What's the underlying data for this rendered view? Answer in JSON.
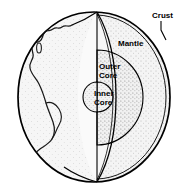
{
  "figure": {
    "kind": "earth-cutaway-cross-section-diagram",
    "style": "black-and-white-line-art-with-stipple-shading",
    "background_color": "#ffffff",
    "line_color": "#000000",
    "fill_color": "#f2f2f2"
  },
  "labels": {
    "crust": "Crust",
    "mantle": "Mantle",
    "outer_core": "Outer\nCore",
    "inner_core": "Inner\nCore"
  },
  "layers": [
    {
      "name": "Crust",
      "label": "Crust",
      "description": "thin double outline at the outer edge of the globe",
      "has_leader_line": true
    },
    {
      "name": "Mantle",
      "label": "Mantle",
      "description": "stippled region between the crust and the outer core on the cut face",
      "has_leader_line": false
    },
    {
      "name": "Outer Core",
      "label": "Outer\nCore",
      "description": "stippled semicircular band inside the mantle",
      "has_leader_line": false
    },
    {
      "name": "Inner Core",
      "label": "Inner\nCore",
      "description": "small stippled circle at the centre of the globe",
      "has_leader_line": false
    }
  ],
  "surface": {
    "description": "left hemisphere of the globe showing a coastline outline and a small island"
  }
}
